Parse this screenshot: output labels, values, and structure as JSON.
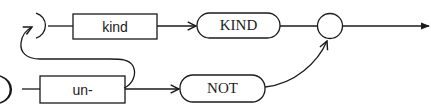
{
  "diagram": {
    "type": "syntax-railroad",
    "colors": {
      "stroke": "#1a1a1a",
      "background": "#ffffff"
    },
    "nodes": [
      {
        "id": "kind",
        "label": "kind",
        "shape": "rectangle",
        "kind": "nonterminal"
      },
      {
        "id": "KIND",
        "label": "KIND",
        "shape": "rounded",
        "kind": "terminal"
      },
      {
        "id": "un",
        "label": "un-",
        "shape": "rectangle",
        "kind": "nonterminal"
      },
      {
        "id": "NOT",
        "label": "NOT",
        "shape": "rounded",
        "kind": "terminal"
      },
      {
        "id": "join",
        "label": "",
        "shape": "circle",
        "kind": "junction"
      }
    ],
    "edges": [
      {
        "from": "top-entry",
        "to": "kind"
      },
      {
        "from": "kind",
        "to": "KIND"
      },
      {
        "from": "KIND",
        "to": "join"
      },
      {
        "from": "bottom-entry",
        "to": "un"
      },
      {
        "from": "un",
        "to": "NOT"
      },
      {
        "from": "un",
        "to": "top-entry",
        "note": "loop back"
      },
      {
        "from": "NOT",
        "to": "join"
      },
      {
        "from": "join",
        "to": "exit"
      }
    ]
  }
}
